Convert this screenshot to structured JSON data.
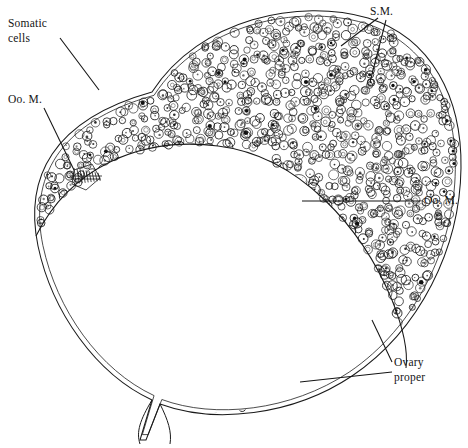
{
  "figure": {
    "kind": "scientific-line-drawing",
    "background_color": "#ffffff",
    "ink_color": "#141414"
  },
  "labels": {
    "somatic_cells": "Somatic\ncells",
    "oocyte_membrane_left": "Oo. M.",
    "somatic_membrane": "S.M.",
    "oocyte_membrane_right": "Oo. M.",
    "ovary_proper": "Ovary\nproper"
  },
  "regions": {
    "outer_outline": "M 152 92 C 200 18, 300 -2, 368 18 C 432 38, 462 98, 461 168 C 460 248, 420 330, 352 376 C 292 416, 214 424, 160 404 L 146 440 L 140 440 L 152 400 C 96 374, 52 312, 38 246 C 24 178, 52 120, 152 92 Z",
    "inner_outline_offset": 4,
    "divider": "M 36 236 C 70 168, 140 136, 218 146 C 300 156, 362 228, 392 300 C 404 330, 408 352, 406 368",
    "stalk": "M 152 400 C 140 420, 136 432, 140 444 M 160 404 C 168 420, 172 432, 170 444"
  },
  "cells": {
    "somatic": {
      "name": "somatic-cells",
      "count": 760,
      "radius_range": [
        3.0,
        5.0
      ],
      "description": "small densely packed circles with tiny central dot"
    },
    "oocytes": {
      "name": "oocyte-cells",
      "count": 230,
      "radius_range": [
        4.5,
        15.5
      ],
      "description": "larger circles with stippled cytoplasm and dark chromatin clumps"
    }
  },
  "leaders": {
    "somatic_cells": "M 60 38 L 99 90",
    "oocyte_membrane_left": "M 44 108 L 74 170",
    "somatic_membrane_a": "M 378 18 L 341 46",
    "somatic_membrane_b": "M 386 20 L 370 82",
    "oocyte_membrane_right": "M 420 201 L 302 201",
    "ovary_proper_a": "M 392 362 L 372 320",
    "ovary_proper_b": "M 392 372 L 300 382"
  }
}
